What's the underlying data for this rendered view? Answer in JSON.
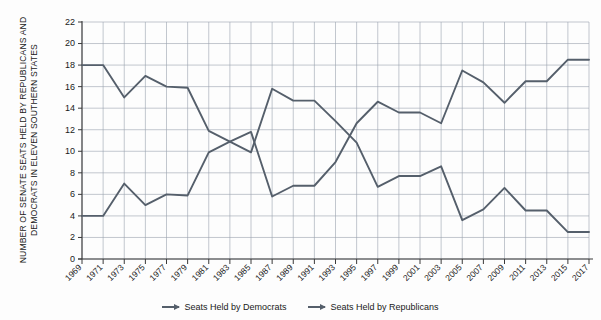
{
  "chart_data": {
    "type": "line",
    "title": "",
    "xlabel": "",
    "ylabel": "NUMBER OF SENATE SEATS HELD BY REPUBLICANS AND DEMOCRATS IN ELEVEN SOUTHERN STATES",
    "ylim": [
      0,
      22
    ],
    "ytick_step": 2,
    "yticks": [
      0,
      2,
      4,
      6,
      8,
      10,
      12,
      14,
      16,
      18,
      20,
      22
    ],
    "grid": true,
    "legend_position": "bottom",
    "categories": [
      "1969",
      "1971",
      "1973",
      "1975",
      "1977",
      "1979",
      "1981",
      "1983",
      "1985",
      "1987",
      "1989",
      "1991",
      "1993",
      "1995",
      "1997",
      "1999",
      "2001",
      "2003",
      "2005",
      "2007",
      "2009",
      "2011",
      "2013",
      "2015",
      "2017"
    ],
    "series": [
      {
        "name": "Seats Held by Democrats",
        "color": "#555f6b",
        "values": [
          18,
          18,
          15,
          17,
          16,
          15.9,
          11.9,
          10.9,
          9.9,
          15.8,
          14.7,
          14.7,
          12.8,
          10.8,
          6.7,
          7.7,
          7.7,
          8.6,
          3.6,
          4.6,
          6.6,
          4.5,
          4.5,
          2.5,
          2.5
        ]
      },
      {
        "name": "Seats Held by Republicans",
        "color": "#555f6b",
        "values": [
          4,
          4,
          7,
          5,
          6,
          5.9,
          9.9,
          10.9,
          11.8,
          5.8,
          6.8,
          6.8,
          9,
          12.6,
          14.6,
          13.6,
          13.6,
          12.6,
          17.5,
          16.4,
          14.5,
          16.5,
          16.5,
          18.5,
          18.5
        ]
      }
    ]
  },
  "legend": {
    "items": [
      {
        "label": "Seats Held by Democrats"
      },
      {
        "label": "Seats Held by Republicans"
      }
    ]
  },
  "axis": {
    "y_title": "NUMBER OF SENATE SEATS HELD BY REPUBLICANS AND DEMOCRATS IN ELEVEN SOUTHERN STATES"
  }
}
